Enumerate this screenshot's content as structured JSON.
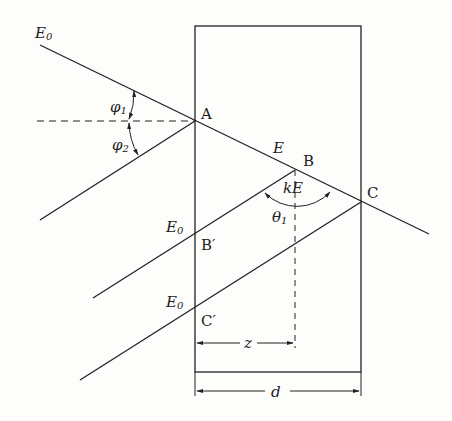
{
  "diagram": {
    "type": "ray-geometry",
    "labels": {
      "E0_top": "E",
      "E0_top_sub": "0",
      "A": "A",
      "B": "B",
      "C": "C",
      "E": "E",
      "kE": "kE",
      "phi1": "φ",
      "phi1_sub": "1",
      "phi2": "φ",
      "phi2_sub": "2",
      "theta1": "θ",
      "theta1_sub": "1",
      "E0_mid": "E",
      "E0_mid_sub": "0",
      "E0_low": "E",
      "E0_low_sub": "0",
      "Bprime": "B′",
      "Cprime": "C′",
      "z": "z",
      "d": "d"
    },
    "points": {
      "A": [
        195,
        121
      ],
      "B": [
        295,
        170
      ],
      "C": [
        361,
        202
      ],
      "Bprime": [
        195,
        233
      ],
      "Cprime": [
        195,
        307
      ]
    }
  }
}
